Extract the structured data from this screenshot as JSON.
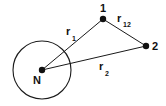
{
  "figure": {
    "background_color": "#ffffff",
    "stroke_color": "#1a1a1a",
    "width": 166,
    "height": 106
  },
  "nucleus": {
    "label": "N",
    "label_x": 33,
    "label_y": 84,
    "center_x": 42,
    "center_y": 70,
    "circle_radius": 29,
    "dot_radius": 3.2
  },
  "particles": [
    {
      "id": "particle-1",
      "label": "1",
      "x": 103,
      "y": 19,
      "label_x": 100,
      "label_y": 12,
      "dot_radius": 3.2
    },
    {
      "id": "particle-2",
      "label": "2",
      "x": 146,
      "y": 46,
      "label_x": 152,
      "label_y": 50,
      "dot_radius": 3.2
    }
  ],
  "vectors": [
    {
      "id": "r1",
      "base": "r",
      "subscript": "1",
      "from_x": 42,
      "from_y": 70,
      "to_x": 103,
      "to_y": 19,
      "label_x": 66,
      "label_y": 35,
      "sub_x": 72,
      "sub_y": 41
    },
    {
      "id": "r2",
      "base": "r",
      "subscript": "2",
      "from_x": 42,
      "from_y": 70,
      "to_x": 146,
      "to_y": 46,
      "label_x": 99,
      "label_y": 70,
      "sub_x": 105,
      "sub_y": 76
    },
    {
      "id": "r12",
      "base": "r",
      "subscript": "12",
      "from_x": 103,
      "from_y": 19,
      "to_x": 146,
      "to_y": 46,
      "label_x": 117,
      "label_y": 22,
      "sub_x": 123,
      "sub_y": 27
    }
  ]
}
